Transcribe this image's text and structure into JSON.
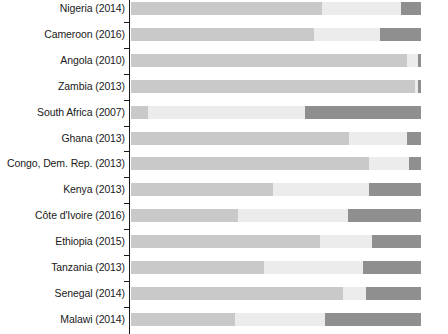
{
  "chart_data": {
    "type": "bar",
    "subtype": "stacked-horizontal-100pct",
    "title": "",
    "subtitle": "",
    "xlabel": "",
    "ylabel": "",
    "xlim": [
      0,
      100
    ],
    "grid": false,
    "legend": null,
    "axis": {
      "category_axis": "y",
      "value_axis": "x",
      "value_unit": "percent",
      "stack_total": 100
    },
    "categories": [
      "Nigeria (2014)",
      "Cameroon (2016)",
      "Angola (2010)",
      "Zambia (2013)",
      "South Africa (2007)",
      "Ghana (2013)",
      "Congo, Dem. Rep. (2013)",
      "Kenya (2013)",
      "Côte d'Ivoire (2016)",
      "Ethiopia (2015)",
      "Tanzania (2013)",
      "Senegal (2014)",
      "Malawi (2014)"
    ],
    "series": [
      {
        "name": "segment-1",
        "color": "#c9c9c9",
        "values": [
          66,
          63,
          95,
          98,
          6,
          75,
          82,
          49,
          37,
          65,
          46,
          73,
          36
        ]
      },
      {
        "name": "segment-2",
        "color": "#ececec",
        "values": [
          27,
          23,
          4,
          1,
          54,
          20,
          14,
          33,
          38,
          18,
          34,
          8,
          31
        ]
      },
      {
        "name": "segment-3",
        "color": "#8f8f8f",
        "values": [
          7,
          14,
          1,
          1,
          40,
          5,
          4,
          18,
          25,
          17,
          20,
          19,
          33
        ]
      }
    ],
    "rows": [
      {
        "label": "Nigeria (2014)",
        "values": [
          66,
          27,
          7
        ]
      },
      {
        "label": "Cameroon (2016)",
        "values": [
          63,
          23,
          14
        ]
      },
      {
        "label": "Angola (2010)",
        "values": [
          95,
          4,
          1
        ]
      },
      {
        "label": "Zambia (2013)",
        "values": [
          98,
          1,
          1
        ]
      },
      {
        "label": "South Africa (2007)",
        "values": [
          6,
          54,
          40
        ]
      },
      {
        "label": "Ghana (2013)",
        "values": [
          75,
          20,
          5
        ]
      },
      {
        "label": "Congo, Dem. Rep. (2013)",
        "values": [
          82,
          14,
          4
        ]
      },
      {
        "label": "Kenya (2013)",
        "values": [
          49,
          33,
          18
        ]
      },
      {
        "label": "Côte d'Ivoire (2016)",
        "values": [
          37,
          38,
          25
        ]
      },
      {
        "label": "Ethiopia (2015)",
        "values": [
          65,
          18,
          17
        ]
      },
      {
        "label": "Tanzania (2013)",
        "values": [
          46,
          34,
          20
        ]
      },
      {
        "label": "Senegal (2014)",
        "values": [
          73,
          8,
          19
        ]
      },
      {
        "label": "Malawi (2014)",
        "values": [
          36,
          31,
          33
        ]
      }
    ]
  },
  "colors": {
    "segment_1": "#c9c9c9",
    "segment_2": "#ececec",
    "segment_3": "#8f8f8f",
    "axis": "#1a1a1a",
    "label_text": "#1a1a1a",
    "background": "#ffffff"
  }
}
